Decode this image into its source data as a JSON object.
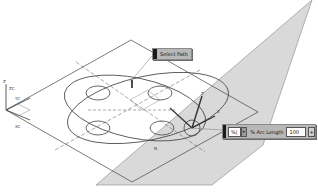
{
  "viewport": {
    "background": "#ffffff",
    "plane_fill": "#d9d9d9",
    "line_color": "#333333",
    "axes": {
      "z_label": "Z",
      "zc_label": "ZC",
      "yc_label": "YC",
      "xc_label": "XC"
    },
    "handle_labels": {
      "z": "Z",
      "x": "X",
      "n": "N"
    }
  },
  "select_path_tooltip": {
    "label": "Select Path"
  },
  "arc_length_box": {
    "mode_icon": "%|",
    "dropdown_icon": "chevron-down",
    "label": "% Arc Length",
    "value": "100",
    "stepper_icon": "+"
  }
}
